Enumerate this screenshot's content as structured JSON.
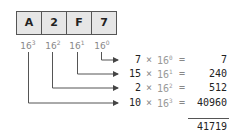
{
  "hex_number": {
    "digits": [
      "A",
      "2",
      "F",
      "7"
    ]
  },
  "place_values": [
    {
      "base": "16",
      "exp": "3"
    },
    {
      "base": "16",
      "exp": "2"
    },
    {
      "base": "16",
      "exp": "1"
    },
    {
      "base": "16",
      "exp": "0"
    }
  ],
  "rows": [
    {
      "coef": "7",
      "times": "×",
      "base": "16",
      "exp": "0",
      "eq": "=",
      "result": "7"
    },
    {
      "coef": "15",
      "times": "×",
      "base": "16",
      "exp": "1",
      "eq": "=",
      "result": "240"
    },
    {
      "coef": "2",
      "times": "×",
      "base": "16",
      "exp": "2",
      "eq": "=",
      "result": "512"
    },
    {
      "coef": "10",
      "times": "×",
      "base": "16",
      "exp": "3",
      "eq": "=",
      "result": "40960"
    }
  ],
  "total": "41719",
  "colors": {
    "line": "#555555",
    "cell_fill": "#e6e6e6",
    "muted_text": "#888888"
  }
}
